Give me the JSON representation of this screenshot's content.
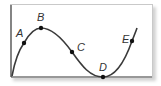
{
  "diagram": {
    "type": "function-curve",
    "points": [
      {
        "label": "A",
        "x": 24,
        "y": 43,
        "lx": 16,
        "ly": 37
      },
      {
        "label": "B",
        "x": 41,
        "y": 28,
        "lx": 37,
        "ly": 21
      },
      {
        "label": "C",
        "x": 72,
        "y": 52,
        "lx": 77,
        "ly": 51
      },
      {
        "label": "D",
        "x": 103,
        "y": 77,
        "lx": 99,
        "ly": 71
      },
      {
        "label": "E",
        "x": 132,
        "y": 41,
        "lx": 122,
        "ly": 43
      }
    ],
    "colors": {
      "curve": "#3a3a3a",
      "axis": "#333333",
      "frame": "#c9c9c9"
    }
  }
}
